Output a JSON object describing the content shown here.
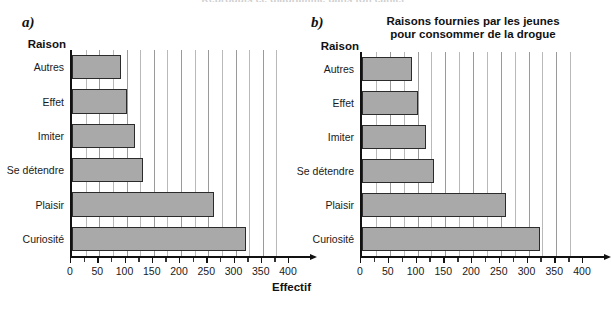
{
  "page": {
    "cut_off_header": "Reproduis ce diagramme dans ton cahier"
  },
  "chart_data": [
    {
      "id": "a",
      "panel_label": "a)",
      "type": "bar",
      "orientation": "horizontal",
      "title": "",
      "ylabel": "Raison",
      "xlabel": "Effectif",
      "categories": [
        "Autres",
        "Effet",
        "Imiter",
        "Se détendre",
        "Plaisir",
        "Curiosité"
      ],
      "values": [
        90,
        100,
        115,
        130,
        260,
        320
      ],
      "xlim": [
        0,
        400
      ],
      "xticks": [
        0,
        50,
        100,
        150,
        200,
        250,
        300,
        350,
        400
      ],
      "xtick_labels": [
        "0",
        "50",
        "100",
        "150",
        "200",
        "250",
        "300",
        "350",
        "400"
      ],
      "minor_tick_step": 25,
      "grid": true,
      "bar_fill": "#a9a9a9",
      "bar_stroke": "#2b2b2b"
    },
    {
      "id": "b",
      "panel_label": "b)",
      "type": "bar",
      "orientation": "horizontal",
      "title": "Raisons fournies par les jeunes\npour consommer de la drogue",
      "title_line1": "Raisons fournies par les jeunes",
      "title_line2": "pour consommer de la drogue",
      "ylabel": "Raison",
      "xlabel": "",
      "categories": [
        "Autres",
        "Effet",
        "Imiter",
        "Se détendre",
        "Plaisir",
        "Curiosité"
      ],
      "values": [
        90,
        100,
        115,
        130,
        260,
        320
      ],
      "xlim": [
        0,
        400
      ],
      "xticks": [
        0,
        50,
        100,
        150,
        200,
        250,
        300,
        350,
        400
      ],
      "xtick_labels": [
        "0",
        "50",
        "100",
        "150",
        "200",
        "250",
        "300",
        "350",
        "400"
      ],
      "minor_tick_step": 25,
      "grid": true,
      "bar_fill": "#a9a9a9",
      "bar_stroke": "#2b2b2b"
    }
  ]
}
